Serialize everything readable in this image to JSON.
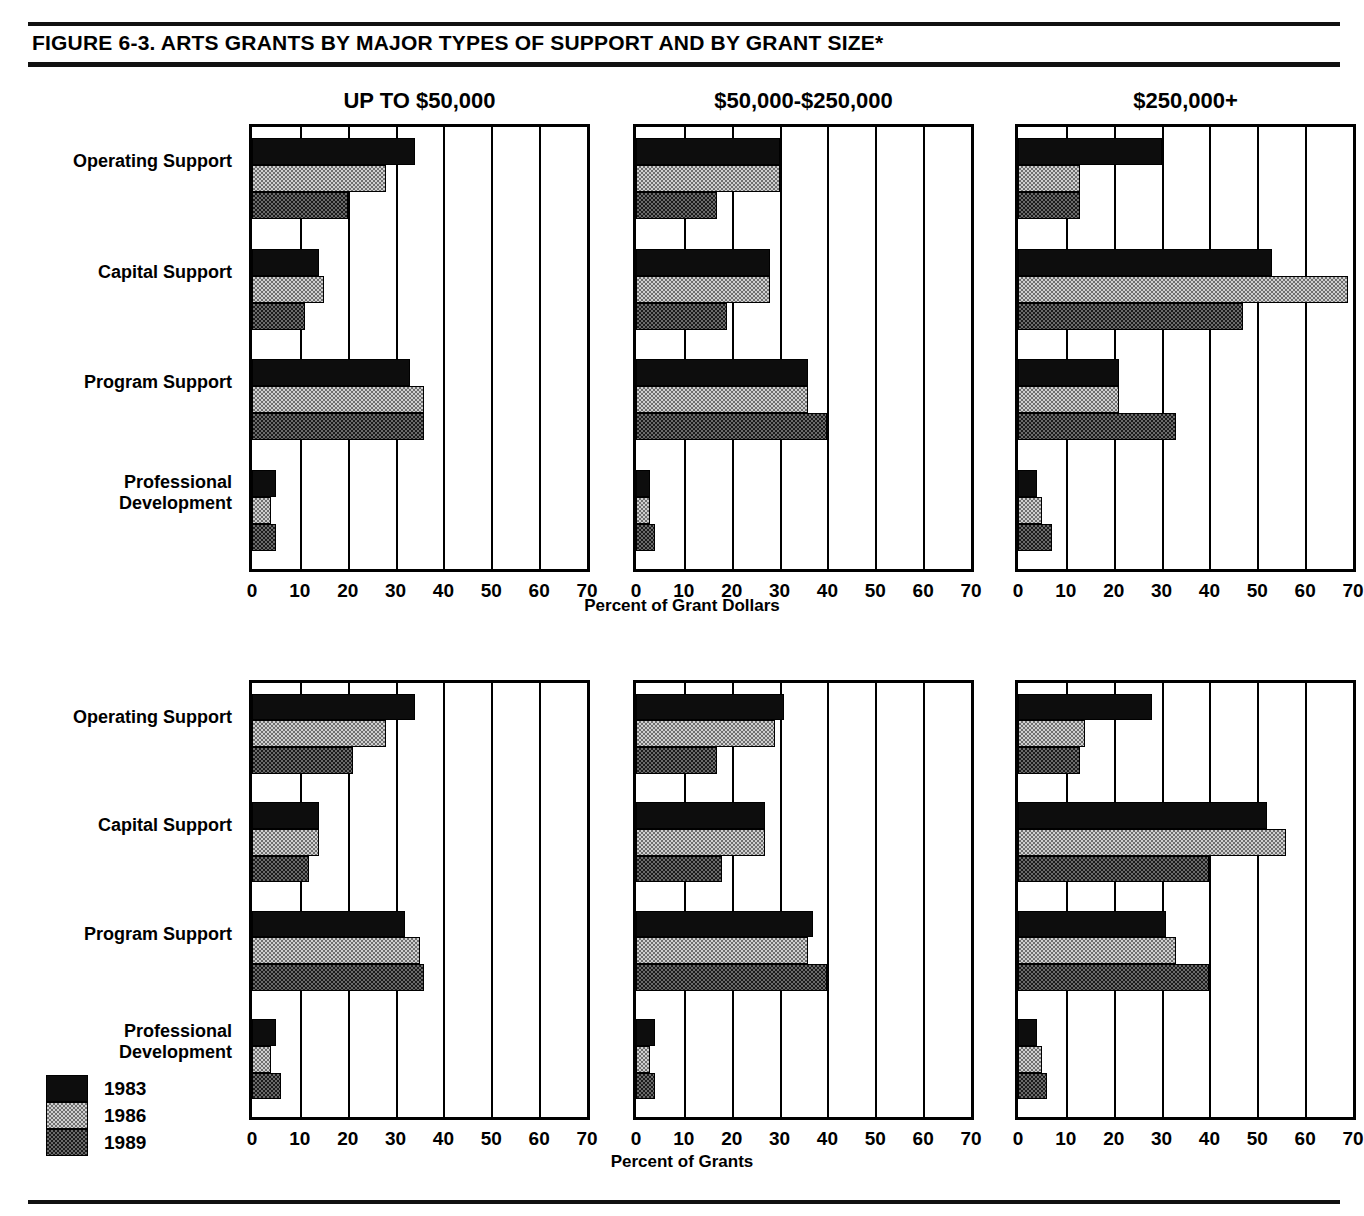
{
  "figure": {
    "title": "FIGURE  6-3.  ARTS GRANTS BY MAJOR TYPES OF SUPPORT AND BY GRANT SIZE*"
  },
  "legend": {
    "items": [
      {
        "label": "1983",
        "swatch": "solid-black-swatch"
      },
      {
        "label": "1986",
        "swatch": "light-stipple-swatch"
      },
      {
        "label": "1989",
        "swatch": "dark-stipple-swatch"
      }
    ]
  },
  "categories": [
    "Operating Support",
    "Capital Support",
    "Program Support",
    "Professional\nDevelopment"
  ],
  "ticks": [
    "0",
    "10",
    "20",
    "30",
    "40",
    "50",
    "60",
    "70"
  ],
  "panel_titles": [
    "UP TO $50,000",
    "$50,000-$250,000",
    "$250,000+"
  ],
  "axis_titles": {
    "top": "Percent of Grant Dollars",
    "bottom": "Percent of Grants"
  },
  "chart_data": {
    "type": "bar",
    "title": "ARTS GRANTS BY MAJOR TYPES OF SUPPORT AND BY GRANT SIZE",
    "orientation": "horizontal",
    "categories": [
      "Operating Support",
      "Capital Support",
      "Program Support",
      "Professional Development"
    ],
    "xlabel": "Percent",
    "ylabel": "",
    "xlim": [
      0,
      70
    ],
    "xticks": [
      0,
      10,
      20,
      30,
      40,
      50,
      60,
      70
    ],
    "grid": true,
    "legend": [
      "1983",
      "1986",
      "1989"
    ],
    "legend_position": "bottom-left",
    "panels": [
      {
        "row": "Percent of Grant Dollars",
        "title": "UP TO $50,000",
        "series": [
          {
            "name": "1983",
            "values": [
              34,
              14,
              33,
              5
            ]
          },
          {
            "name": "1986",
            "values": [
              28,
              15,
              36,
              4
            ]
          },
          {
            "name": "1989",
            "values": [
              20,
              11,
              36,
              5
            ]
          }
        ]
      },
      {
        "row": "Percent of Grant Dollars",
        "title": "$50,000-$250,000",
        "series": [
          {
            "name": "1983",
            "values": [
              30,
              28,
              36,
              3
            ]
          },
          {
            "name": "1986",
            "values": [
              30,
              28,
              36,
              3
            ]
          },
          {
            "name": "1989",
            "values": [
              17,
              19,
              40,
              4
            ]
          }
        ]
      },
      {
        "row": "Percent of Grant Dollars",
        "title": "$250,000+",
        "series": [
          {
            "name": "1983",
            "values": [
              30,
              53,
              21,
              4
            ]
          },
          {
            "name": "1986",
            "values": [
              13,
              69,
              21,
              5
            ]
          },
          {
            "name": "1989",
            "values": [
              13,
              47,
              33,
              7
            ]
          }
        ]
      },
      {
        "row": "Percent of Grants",
        "title": "UP TO $50,000",
        "series": [
          {
            "name": "1983",
            "values": [
              34,
              14,
              32,
              5
            ]
          },
          {
            "name": "1986",
            "values": [
              28,
              14,
              35,
              4
            ]
          },
          {
            "name": "1989",
            "values": [
              21,
              12,
              36,
              6
            ]
          }
        ]
      },
      {
        "row": "Percent of Grants",
        "title": "$50,000-$250,000",
        "series": [
          {
            "name": "1983",
            "values": [
              31,
              27,
              37,
              4
            ]
          },
          {
            "name": "1986",
            "values": [
              29,
              27,
              36,
              3
            ]
          },
          {
            "name": "1989",
            "values": [
              17,
              18,
              40,
              4
            ]
          }
        ]
      },
      {
        "row": "Percent of Grants",
        "title": "$250,000+",
        "series": [
          {
            "name": "1983",
            "values": [
              28,
              52,
              31,
              4
            ]
          },
          {
            "name": "1986",
            "values": [
              14,
              56,
              33,
              5
            ]
          },
          {
            "name": "1989",
            "values": [
              13,
              40,
              40,
              6
            ]
          }
        ]
      }
    ]
  }
}
